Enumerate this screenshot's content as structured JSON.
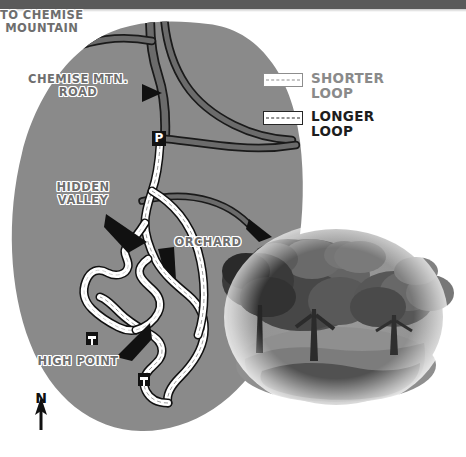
{
  "page": {
    "background_color": "#ffffff",
    "topbar_color": "#5a5a5a"
  },
  "map": {
    "landmass_color": "#8a8a8a",
    "road_color": "#6b6b6b",
    "road_outline_color": "#1a1a1a",
    "trail_fill_color": "#ffffff",
    "trail_outline_color": "#111111",
    "labels": [
      {
        "id": "chemise-mtn-road",
        "text": "CHEMISE MTN.\nROAD"
      },
      {
        "id": "hidden-valley",
        "text": "HIDDEN\nVALLEY"
      },
      {
        "id": "orchard",
        "text": "ORCHARD"
      },
      {
        "id": "to-chemise-mountain",
        "text": "TO CHEMISE\nMOUNTAIN"
      },
      {
        "id": "high-point",
        "text": "HIGH POINT"
      }
    ]
  },
  "legend": {
    "items": [
      {
        "id": "shorter-loop",
        "label": "SHORTER\nLOOP",
        "line_style": "dashed",
        "color": "#8a8a8a"
      },
      {
        "id": "longer-loop",
        "label": "LONGER\nLOOP",
        "line_style": "dashed",
        "color": "#1d1d1d"
      }
    ]
  },
  "markers": {
    "parking": {
      "symbol": "P",
      "name": "parking-marker"
    },
    "trailheads": [
      {
        "id": "trailhead-1",
        "icon": "trailhead-post-icon"
      },
      {
        "id": "trailhead-2",
        "icon": "trailhead-post-icon"
      }
    ]
  },
  "compass": {
    "direction_letter": "N",
    "icon": "north-arrow-icon"
  },
  "photo": {
    "caption": "",
    "subject": "orchard-trees-photo",
    "style": "grayscale vignette"
  }
}
